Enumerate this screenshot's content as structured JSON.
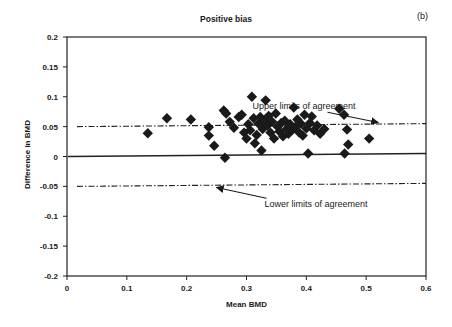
{
  "chart_data": {
    "type": "scatter",
    "title": "Positive bias",
    "panel_label": "(b)",
    "xlabel": "Mean BMD",
    "ylabel": "Difference in BMD",
    "xlim": [
      0,
      0.6
    ],
    "ylim": [
      -0.2,
      0.2
    ],
    "xticks": [
      "0",
      "0.1",
      "0.2",
      "0.3",
      "0.4",
      "0.5",
      "0.6"
    ],
    "yticks": [
      "0.2",
      "0.15",
      "0.1",
      "0.05",
      "0",
      "-0.05",
      "-0.1",
      "-0.15",
      "-0.2"
    ],
    "grid": false,
    "legend": null,
    "marker": "diamond",
    "reference_lines": [
      {
        "name": "Upper limits of agreement",
        "style": "dash-dot",
        "y_start": 0.05,
        "y_end": 0.055
      },
      {
        "name": "Mean difference",
        "style": "solid",
        "y_start": 0.0,
        "y_end": 0.005
      },
      {
        "name": "Lower limits of agreement",
        "style": "dash-dot",
        "y_start": -0.05,
        "y_end": -0.045
      }
    ],
    "annotations": [
      {
        "text": "Upper limits of agreement",
        "text_pos": [
          0.31,
          0.079
        ],
        "arrow_to": [
          0.52,
          0.057
        ]
      },
      {
        "text": "Lower limits of agreement",
        "text_pos": [
          0.33,
          -0.085
        ],
        "arrow_to": [
          0.25,
          -0.052
        ]
      }
    ],
    "series": [
      {
        "name": "Positive bias",
        "points": [
          [
            0.135,
            0.039
          ],
          [
            0.167,
            0.064
          ],
          [
            0.207,
            0.062
          ],
          [
            0.237,
            0.049
          ],
          [
            0.237,
            0.035
          ],
          [
            0.246,
            0.018
          ],
          [
            0.264,
            -0.002
          ],
          [
            0.262,
            0.077
          ],
          [
            0.266,
            0.072
          ],
          [
            0.272,
            0.058
          ],
          [
            0.279,
            0.048
          ],
          [
            0.287,
            0.066
          ],
          [
            0.292,
            0.07
          ],
          [
            0.296,
            0.04
          ],
          [
            0.3,
            0.03
          ],
          [
            0.303,
            0.054
          ],
          [
            0.306,
            0.044
          ],
          [
            0.309,
            0.1
          ],
          [
            0.312,
            0.064
          ],
          [
            0.314,
            0.022
          ],
          [
            0.317,
            0.036
          ],
          [
            0.32,
            0.055
          ],
          [
            0.323,
            0.066
          ],
          [
            0.325,
            0.01
          ],
          [
            0.327,
            0.046
          ],
          [
            0.33,
            0.06
          ],
          [
            0.332,
            0.094
          ],
          [
            0.335,
            0.052
          ],
          [
            0.337,
            0.068
          ],
          [
            0.34,
            0.04
          ],
          [
            0.343,
            0.058
          ],
          [
            0.346,
            0.03
          ],
          [
            0.349,
            0.072
          ],
          [
            0.352,
            0.05
          ],
          [
            0.355,
            0.042
          ],
          [
            0.358,
            0.056
          ],
          [
            0.361,
            0.034
          ],
          [
            0.364,
            0.06
          ],
          [
            0.367,
            0.046
          ],
          [
            0.37,
            0.038
          ],
          [
            0.373,
            0.054
          ],
          [
            0.376,
            0.044
          ],
          [
            0.379,
            0.082
          ],
          [
            0.382,
            0.05
          ],
          [
            0.385,
            0.062
          ],
          [
            0.388,
            0.04
          ],
          [
            0.391,
            0.055
          ],
          [
            0.394,
            0.035
          ],
          [
            0.397,
            0.07
          ],
          [
            0.4,
            0.047
          ],
          [
            0.403,
            0.005
          ],
          [
            0.406,
            0.056
          ],
          [
            0.409,
            0.067
          ],
          [
            0.413,
            0.044
          ],
          [
            0.418,
            0.052
          ],
          [
            0.423,
            0.038
          ],
          [
            0.43,
            0.046
          ],
          [
            0.455,
            0.08
          ],
          [
            0.463,
            0.07
          ],
          [
            0.468,
            0.045
          ],
          [
            0.47,
            0.02
          ],
          [
            0.464,
            0.005
          ],
          [
            0.505,
            0.03
          ]
        ]
      }
    ]
  }
}
